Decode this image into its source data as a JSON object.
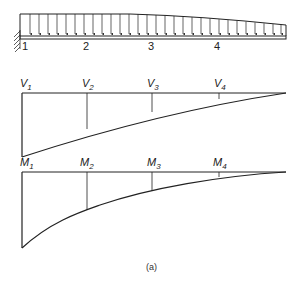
{
  "figure": {
    "caption": "(a)",
    "beam": {
      "node_labels": [
        "1",
        "2",
        "3",
        "4"
      ],
      "support": "fixed",
      "load": "distributed, decreasing toward free end"
    },
    "shear_diagram": {
      "symbol": "V",
      "labels": [
        {
          "main": "V",
          "sub": "1"
        },
        {
          "main": "V",
          "sub": "2"
        },
        {
          "main": "V",
          "sub": "3"
        },
        {
          "main": "V",
          "sub": "4"
        }
      ]
    },
    "moment_diagram": {
      "symbol": "M",
      "labels": [
        {
          "main": "M",
          "sub": "1"
        },
        {
          "main": "M",
          "sub": "2"
        },
        {
          "main": "M",
          "sub": "3"
        },
        {
          "main": "M",
          "sub": "4"
        }
      ]
    }
  },
  "colors": {
    "line": "#222222",
    "background": "#ffffff"
  }
}
